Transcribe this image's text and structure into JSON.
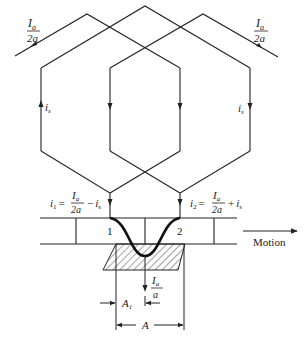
{
  "diagram": {
    "title": "",
    "leads": {
      "left": {
        "num": "I",
        "num_sub": "a",
        "den": "2a"
      },
      "right": {
        "num": "I",
        "num_sub": "a",
        "den": "2a"
      }
    },
    "coil_current_label_left": {
      "var": "i",
      "sub": "s"
    },
    "coil_current_label_right": {
      "var": "i",
      "sub": "s"
    },
    "i1": {
      "lhs": "i",
      "lhs_sub": "1",
      "eq": "=",
      "frac_num": "I",
      "frac_num_sub": "a",
      "frac_den": "2a",
      "op": "−",
      "rhs": "i",
      "rhs_sub": "s"
    },
    "i2": {
      "lhs": "i",
      "lhs_sub": "2",
      "eq": "=",
      "frac_num": "I",
      "frac_num_sub": "a",
      "frac_den": "2a",
      "op": "+",
      "rhs": "i",
      "rhs_sub": "s"
    },
    "segments": {
      "seg1": "1",
      "seg2": "2"
    },
    "motion_label": "Motion",
    "brush_current": {
      "num": "I",
      "num_sub": "a",
      "den": "a"
    },
    "dim_A1": {
      "var": "A",
      "sub": "1"
    },
    "dim_A": "A",
    "colors": {
      "line": "#222222",
      "hatch": "#333333",
      "background": "#ffffff"
    }
  }
}
